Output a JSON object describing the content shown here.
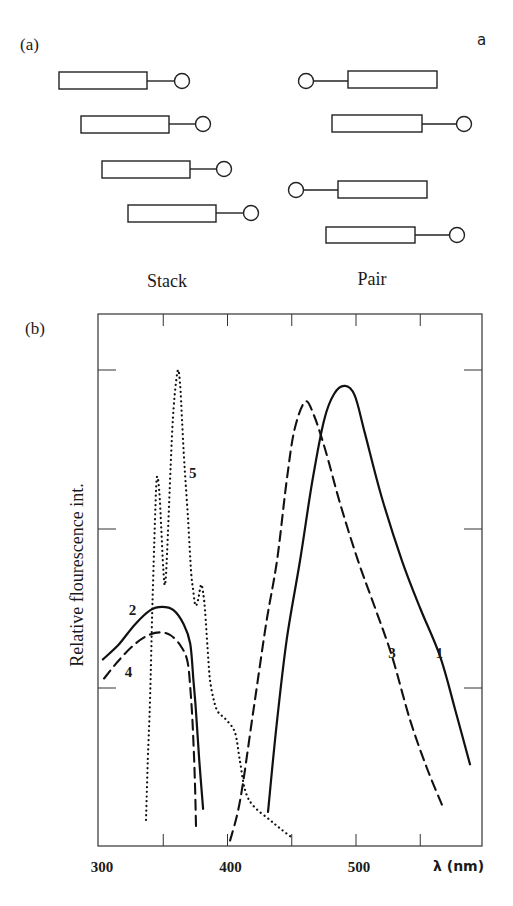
{
  "corner_mark": "a",
  "panel_a": {
    "label": "(a)",
    "stack_label": "Stack",
    "pair_label": "Pair",
    "stack_units": [
      {
        "rect": [
          59,
          72,
          88,
          17
        ],
        "circle": [
          182,
          81
        ],
        "tail": "right"
      },
      {
        "rect": [
          81,
          116,
          88,
          17
        ],
        "circle": [
          203,
          124
        ],
        "tail": "right"
      },
      {
        "rect": [
          102,
          161,
          88,
          17
        ],
        "circle": [
          224,
          169
        ],
        "tail": "right"
      },
      {
        "rect": [
          128,
          205,
          88,
          17
        ],
        "circle": [
          251,
          213
        ],
        "tail": "right"
      }
    ],
    "pair_units": [
      {
        "rect": [
          348,
          71,
          89,
          17
        ],
        "circle": [
          306,
          81
        ],
        "tail": "left"
      },
      {
        "rect": [
          332,
          115,
          90,
          17
        ],
        "circle": [
          464,
          124
        ],
        "tail": "right"
      },
      {
        "rect": [
          338,
          181,
          89,
          17
        ],
        "circle": [
          296,
          190
        ],
        "tail": "left"
      },
      {
        "rect": [
          326,
          227,
          89,
          16
        ],
        "circle": [
          457,
          235
        ],
        "tail": "right"
      }
    ]
  },
  "panel_b": {
    "label": "(b)"
  },
  "chart_data": {
    "type": "line",
    "title": "",
    "xlabel": "λ (nm)",
    "ylabel": "Relative flourescence int.",
    "xlim": [
      300,
      590
    ],
    "ylim": [
      0,
      3.35
    ],
    "x_tick_labels": [
      {
        "value": 300,
        "label": "300"
      },
      {
        "value": 400,
        "label": "400"
      },
      {
        "value": 500,
        "label": "500"
      }
    ],
    "x_minor_ticks": [
      350,
      450,
      550
    ],
    "y_ticks": [
      1,
      2,
      3
    ],
    "y_tick_labels": [],
    "grid": false,
    "legend": "inline curve labels",
    "series": [
      {
        "name": "1",
        "style": "solid",
        "label_pos": [
          565,
          1.22
        ],
        "points": [
          [
            431.5,
            0.22
          ],
          [
            438,
            0.75
          ],
          [
            446,
            1.3
          ],
          [
            456.4,
            1.8
          ],
          [
            466,
            2.3
          ],
          [
            475,
            2.68
          ],
          [
            483,
            2.85
          ],
          [
            491.4,
            2.9
          ],
          [
            499,
            2.84
          ],
          [
            507,
            2.6
          ],
          [
            520,
            2.2
          ],
          [
            535.8,
            1.8
          ],
          [
            550,
            1.5
          ],
          [
            565.4,
            1.2
          ],
          [
            577,
            0.87
          ],
          [
            588.7,
            0.52
          ]
        ]
      },
      {
        "name": "2",
        "style": "solid",
        "label_pos": [
          326,
          1.49
        ],
        "points": [
          [
            303,
            1.18
          ],
          [
            315,
            1.27
          ],
          [
            328,
            1.4
          ],
          [
            340,
            1.49
          ],
          [
            349,
            1.51
          ],
          [
            358,
            1.49
          ],
          [
            366,
            1.4
          ],
          [
            371,
            1.28
          ],
          [
            373.5,
            1.05
          ],
          [
            375.5,
            0.85
          ],
          [
            378,
            0.55
          ],
          [
            381,
            0.24
          ]
        ]
      },
      {
        "name": "3",
        "style": "dashed",
        "label_pos": [
          528,
          1.22
        ],
        "points": [
          [
            402,
            0.04
          ],
          [
            410,
            0.3
          ],
          [
            420,
            0.85
          ],
          [
            430,
            1.4
          ],
          [
            438.5,
            1.8
          ],
          [
            446,
            2.3
          ],
          [
            452,
            2.62
          ],
          [
            460.3,
            2.8
          ],
          [
            467,
            2.72
          ],
          [
            476,
            2.5
          ],
          [
            488,
            2.15
          ],
          [
            501.6,
            1.8
          ],
          [
            515,
            1.5
          ],
          [
            528,
            1.2
          ],
          [
            542,
            0.8
          ],
          [
            555,
            0.5
          ],
          [
            567.7,
            0.25
          ]
        ]
      },
      {
        "name": "4",
        "style": "dashed",
        "label_pos": [
          323,
          1.1
        ],
        "points": [
          [
            304,
            1.06
          ],
          [
            315,
            1.17
          ],
          [
            327,
            1.27
          ],
          [
            338,
            1.33
          ],
          [
            347.5,
            1.35
          ],
          [
            356,
            1.33
          ],
          [
            364,
            1.26
          ],
          [
            369,
            1.16
          ],
          [
            371.5,
            0.95
          ],
          [
            373,
            0.75
          ],
          [
            374.5,
            0.45
          ],
          [
            375.5,
            0.13
          ]
        ]
      },
      {
        "name": "5",
        "style": "dotted",
        "label_pos": [
          373,
          2.35
        ],
        "points": [
          [
            336.6,
            0.17
          ],
          [
            338,
            0.55
          ],
          [
            339.7,
            0.92
          ],
          [
            341.5,
            1.5
          ],
          [
            343.6,
            2.06
          ],
          [
            345,
            2.32
          ],
          [
            346.8,
            2.25
          ],
          [
            348.5,
            2.0
          ],
          [
            350,
            1.75
          ],
          [
            351.4,
            1.65
          ],
          [
            353,
            1.85
          ],
          [
            355.3,
            2.31
          ],
          [
            357.2,
            2.65
          ],
          [
            359,
            2.85
          ],
          [
            361.5,
            3.0
          ],
          [
            363.2,
            2.9
          ],
          [
            364.6,
            2.69
          ],
          [
            366.5,
            2.4
          ],
          [
            369.3,
            2.06
          ],
          [
            371.6,
            1.74
          ],
          [
            373.2,
            1.62
          ],
          [
            375,
            1.52
          ],
          [
            377,
            1.55
          ],
          [
            379.4,
            1.65
          ],
          [
            381,
            1.6
          ],
          [
            382.5,
            1.49
          ],
          [
            384.5,
            1.25
          ],
          [
            386.4,
            1.05
          ],
          [
            389.5,
            0.92
          ],
          [
            392.6,
            0.85
          ],
          [
            399,
            0.8
          ],
          [
            405.8,
            0.72
          ],
          [
            409.5,
            0.55
          ],
          [
            413.6,
            0.36
          ],
          [
            420,
            0.26
          ],
          [
            433,
            0.17
          ],
          [
            442,
            0.11
          ],
          [
            450,
            0.06
          ]
        ]
      }
    ]
  }
}
